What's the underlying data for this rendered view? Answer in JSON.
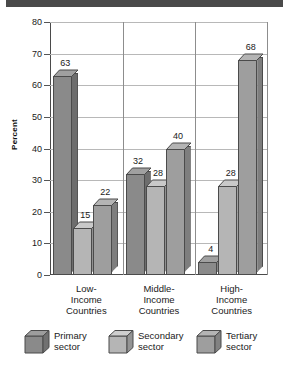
{
  "figure": {
    "banner_color": "#4a4a4a",
    "background": "#ffffff"
  },
  "chart_data": {
    "type": "bar",
    "title": "",
    "subtitle": "",
    "xlabel": "",
    "ylabel": "Percent",
    "ylim": [
      0,
      80
    ],
    "yticks": [
      0,
      10,
      20,
      30,
      40,
      50,
      60,
      70,
      80
    ],
    "ytick_labels": [
      "0",
      "10",
      "20",
      "30",
      "40",
      "50",
      "60",
      "70",
      "80"
    ],
    "grid": true,
    "legend_position": "bottom",
    "categories": [
      "Low-\nIncome\nCountries",
      "Middle-\nIncome\nCountries",
      "High-\nIncome\nCountries"
    ],
    "category_lines": [
      [
        "Low-",
        "Income",
        "Countries"
      ],
      [
        "Middle-",
        "Income",
        "Countries"
      ],
      [
        "High-",
        "Income",
        "Countries"
      ]
    ],
    "series": [
      {
        "name": "Primary sector",
        "values": [
          63,
          32,
          4
        ],
        "color": "#8a8a8a",
        "side_color": "#6d6d6d",
        "top_color": "#a0a0a0"
      },
      {
        "name": "Secondary sector",
        "values": [
          15,
          28,
          28
        ],
        "color": "#b5b5b5",
        "side_color": "#909090",
        "top_color": "#c9c9c9"
      },
      {
        "name": "Tertiary sector",
        "values": [
          22,
          40,
          68
        ],
        "color": "#9e9e9e",
        "side_color": "#7e7e7e",
        "top_color": "#b4b4b4"
      }
    ],
    "data_labels": [
      [
        "63",
        "15",
        "22"
      ],
      [
        "32",
        "28",
        "40"
      ],
      [
        "4",
        "28",
        "68"
      ]
    ]
  },
  "legend": {
    "items": [
      {
        "label_line1": "Primary",
        "label_line2": "sector",
        "color": "#8a8a8a"
      },
      {
        "label_line1": "Secondary",
        "label_line2": "sector",
        "color": "#b5b5b5"
      },
      {
        "label_line1": "Tertiary",
        "label_line2": "sector",
        "color": "#9e9e9e"
      }
    ]
  }
}
